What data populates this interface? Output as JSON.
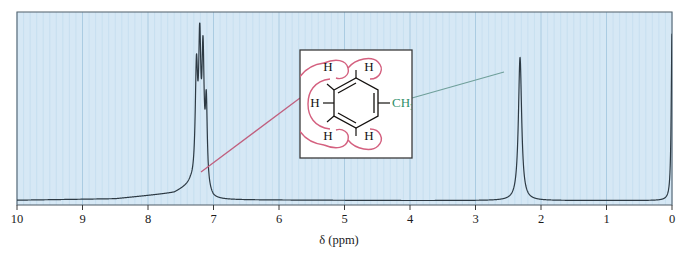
{
  "figure": {
    "kind": "nmr-spectrum",
    "background_color": "#ffffff",
    "plot_fill_color": "#d6e8f5",
    "grid_minor_color": "#bcd8ea",
    "grid_major_color": "#a6c8e0",
    "frame_color": "#5d6b75",
    "trace_color": "#2d3a44",
    "annotation_pink": "#d4607f",
    "annotation_green": "#4f9d82",
    "leader_pink": "#c0607f",
    "leader_green": "#6f9f9a"
  },
  "axis": {
    "title": "δ (ppm)",
    "tick_labels": [
      "10",
      "9",
      "8",
      "7",
      "6",
      "5",
      "4",
      "3",
      "2",
      "1",
      "0"
    ],
    "tick_values": [
      10,
      9,
      8,
      7,
      6,
      5,
      4,
      3,
      2,
      1,
      0
    ],
    "min": 0,
    "max": 10,
    "direction": "reversed",
    "minor_ticks_per_unit": 10
  },
  "inset": {
    "name": "toluene-structure",
    "border_color": "#3b3b3b",
    "fill_color": "#ffffff",
    "aromatic_h_labels": [
      "H",
      "H",
      "H",
      "H",
      "H"
    ],
    "methyl_label_main": "CH",
    "methyl_label_sub": "3",
    "ring_type": "benzene-kekule",
    "highlight_shape": "pink-lasso-around-aromatic-hydrogens"
  },
  "chart_data": {
    "type": "line",
    "title": "",
    "subtitle": "",
    "xlabel": "δ (ppm)",
    "ylabel": "",
    "xlim": [
      10,
      0
    ],
    "ylim": [
      0,
      1
    ],
    "grid": true,
    "legend": "none",
    "x_axis_reversed": true,
    "tick_labels": [
      "10",
      "9",
      "8",
      "7",
      "6",
      "5",
      "4",
      "3",
      "2",
      "1",
      "0"
    ],
    "annotations": [
      {
        "text": "aromatic hydrogens",
        "points_to_ppm": 7.2,
        "from": "inset-left",
        "color": "#c0607f"
      },
      {
        "text": "methyl hydrogens",
        "points_to_ppm": 2.32,
        "from": "inset-right",
        "color": "#6f9f9a"
      }
    ],
    "peaks": [
      {
        "name": "aromatic-multiplet",
        "ppm": 7.26,
        "rel_height": 0.62,
        "width_ppm": 0.022,
        "assignment": "C6H5 (5H)"
      },
      {
        "name": "aromatic-multiplet",
        "ppm": 7.21,
        "rel_height": 0.74,
        "width_ppm": 0.02,
        "assignment": "C6H5 (5H)"
      },
      {
        "name": "aromatic-multiplet",
        "ppm": 7.16,
        "rel_height": 0.7,
        "width_ppm": 0.02,
        "assignment": "C6H5 (5H)"
      },
      {
        "name": "aromatic-multiplet",
        "ppm": 7.11,
        "rel_height": 0.45,
        "width_ppm": 0.018,
        "assignment": "C6H5 (5H)"
      },
      {
        "name": "methyl-singlet",
        "ppm": 2.32,
        "rel_height": 0.8,
        "width_ppm": 0.03,
        "assignment": "CH3 (3H)"
      },
      {
        "name": "tms-reference",
        "ppm": 0.0,
        "rel_height": 0.93,
        "width_ppm": 0.014,
        "assignment": "TMS"
      }
    ],
    "baseline_drift": [
      {
        "ppm": 10.0,
        "rel_height": 0.01
      },
      {
        "ppm": 8.5,
        "rel_height": 0.018
      },
      {
        "ppm": 7.6,
        "rel_height": 0.05
      },
      {
        "ppm": 7.35,
        "rel_height": 0.09
      },
      {
        "ppm": 7.0,
        "rel_height": 0.012
      },
      {
        "ppm": 4.0,
        "rel_height": 0.008
      },
      {
        "ppm": 0.3,
        "rel_height": 0.008
      }
    ]
  }
}
